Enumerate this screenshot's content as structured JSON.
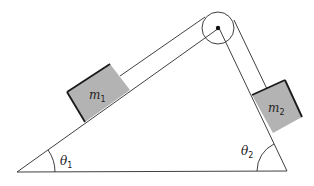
{
  "diagram": {
    "mass1": {
      "symbol": "m",
      "subscript": "1"
    },
    "mass2": {
      "symbol": "m",
      "subscript": "2"
    },
    "angle1": {
      "symbol": "θ",
      "subscript": "1"
    },
    "angle2": {
      "symbol": "θ",
      "subscript": "2"
    },
    "colors": {
      "block": "#b3b3b3",
      "line": "#2a2a2a"
    }
  }
}
